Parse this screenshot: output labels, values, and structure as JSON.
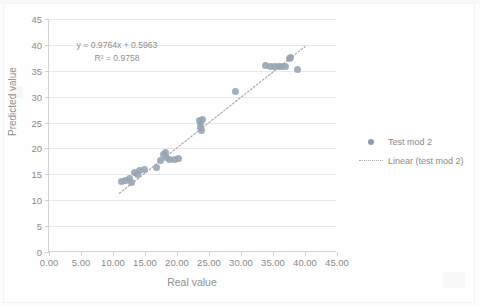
{
  "chart_data": {
    "type": "scatter",
    "title": "",
    "xlabel": "Real value",
    "ylabel": "Predicted value",
    "xlim": [
      0,
      45
    ],
    "ylim": [
      0,
      45
    ],
    "xticks": [
      "0.00",
      "5.00",
      "10.00",
      "15.00",
      "20.00",
      "25.00",
      "30.00",
      "35.00",
      "40.00",
      "45.00"
    ],
    "xtick_values": [
      0,
      5,
      10,
      15,
      20,
      25,
      30,
      35,
      40,
      45
    ],
    "yticks": [
      "0",
      "5",
      "10",
      "15",
      "20",
      "25",
      "30",
      "35",
      "40",
      "45"
    ],
    "ytick_values": [
      0,
      5,
      10,
      15,
      20,
      25,
      30,
      35,
      40,
      45
    ],
    "grid": "horizontal",
    "legend_position": "right",
    "annotations": {
      "equation": "y = 0.9764x + 0.5963",
      "r_squared": "R² = 0.9758"
    },
    "series": [
      {
        "name": "Test mod 2",
        "type": "scatter",
        "marker": "circle",
        "color": "#96a3b3",
        "points": [
          [
            11.4,
            13.6
          ],
          [
            12.0,
            13.9
          ],
          [
            12.6,
            14.1
          ],
          [
            12.9,
            13.5
          ],
          [
            13.4,
            15.3
          ],
          [
            13.9,
            15.0
          ],
          [
            14.2,
            15.7
          ],
          [
            14.9,
            15.9
          ],
          [
            16.8,
            16.3
          ],
          [
            17.4,
            17.6
          ],
          [
            17.9,
            18.9
          ],
          [
            18.2,
            19.2
          ],
          [
            18.4,
            18.3
          ],
          [
            18.9,
            17.9
          ],
          [
            19.6,
            17.8
          ],
          [
            20.3,
            18.0
          ],
          [
            23.5,
            25.4
          ],
          [
            23.6,
            24.9
          ],
          [
            23.7,
            24.1
          ],
          [
            23.8,
            23.4
          ],
          [
            24.0,
            25.5
          ],
          [
            29.2,
            31.0
          ],
          [
            33.9,
            36.0
          ],
          [
            34.6,
            35.9
          ],
          [
            35.3,
            35.8
          ],
          [
            35.9,
            35.9
          ],
          [
            36.4,
            35.8
          ],
          [
            37.0,
            35.9
          ],
          [
            37.6,
            37.3
          ],
          [
            37.8,
            37.6
          ],
          [
            38.9,
            35.2
          ]
        ]
      },
      {
        "name": "Linear (test mod 2)",
        "type": "line",
        "style": "dotted",
        "color": "#a8a8a8",
        "slope": 0.9764,
        "intercept": 0.5963,
        "x_range": [
          11.0,
          40.0
        ]
      }
    ]
  },
  "legend": {
    "items": [
      {
        "label": "Test mod 2",
        "key": "scatter-marker-icon"
      },
      {
        "label": "Linear (test mod 2)",
        "key": "dotted-line-icon"
      }
    ]
  },
  "colors": {
    "marker": "#96a3b3",
    "trendline": "#a8a8a8",
    "gridline": "#e8e8e8",
    "axis": "#d2d2d2",
    "text": "#8a8a8a"
  }
}
